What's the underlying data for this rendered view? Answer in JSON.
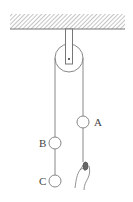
{
  "diagram": {
    "type": "physics-pulley",
    "labels": {
      "a": "A",
      "b": "B",
      "c": "C"
    },
    "colors": {
      "line": "#777777",
      "hatch": "#8a8a8a",
      "background": "#ffffff"
    },
    "elements": [
      "ceiling",
      "bracket",
      "pulley",
      "left-rope",
      "right-rope",
      "ball-a",
      "ball-b",
      "ball-c",
      "hand"
    ]
  }
}
